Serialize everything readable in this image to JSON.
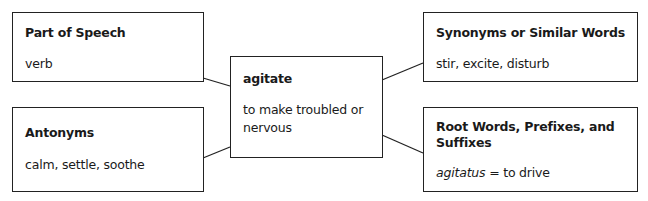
{
  "diagram": {
    "type": "vocabulary-word-map",
    "center": {
      "word": "agitate",
      "definition": "to make troubled or nervous"
    },
    "boxes": {
      "part_of_speech": {
        "title": "Part of Speech",
        "content": "verb"
      },
      "antonyms": {
        "title": "Antonyms",
        "content": "calm, settle, soothe"
      },
      "synonyms": {
        "title": "Synonyms or Similar Words",
        "content": "stir, excite, disturb"
      },
      "roots": {
        "title": "Root Words, Prefixes, and Suffixes",
        "content_italic": "agitatus",
        "content_rest": " = to drive"
      }
    },
    "colors": {
      "border": "#222222",
      "text": "#1a1a1a",
      "background": "#ffffff"
    }
  }
}
